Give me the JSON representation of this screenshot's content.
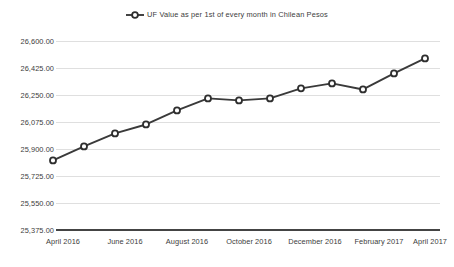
{
  "chart_data": {
    "type": "line",
    "title": "",
    "subtitle": "",
    "xlabel": "",
    "ylabel": "",
    "legend": {
      "position": "top-center",
      "entries": [
        {
          "name": "UF Value as per 1st of every month in Chilean Pesos",
          "marker": "circle-on-line",
          "color": "#3a3a3a"
        }
      ]
    },
    "grid": true,
    "ylim": [
      25375.0,
      26600.0
    ],
    "ytick_step": 175.0,
    "ytick_labels": [
      "26,600.00",
      "26,425.00",
      "26,250.00",
      "26,075.00",
      "25,900.00",
      "25,725.00",
      "25,550.00",
      "25,375.00"
    ],
    "ytick_values": [
      26600.0,
      26425.0,
      26250.0,
      26075.0,
      25900.0,
      25725.0,
      25550.0,
      25375.0
    ],
    "xtick_labels": [
      "April 2016",
      "June 2016",
      "August 2016",
      "October 2016",
      "December 2016",
      "February 2017",
      "April 2017"
    ],
    "categories": [
      "April 2016",
      "May 2016",
      "June 2016",
      "July 2016",
      "August 2016",
      "September 2016",
      "October 2016",
      "November 2016",
      "December 2016",
      "January 2017",
      "February 2017",
      "March 2017",
      "April 2017"
    ],
    "series": [
      {
        "name": "UF Value as per 1st of every month in Chilean Pesos",
        "color": "#3a3a3a",
        "values": [
          25826.0,
          25917.0,
          26001.0,
          26059.0,
          26150.0,
          26228.0,
          26215.0,
          26228.0,
          26293.0,
          26325.0,
          26286.0,
          26390.0,
          26487.0
        ]
      }
    ]
  },
  "colors": {
    "line": "#3a3a3a",
    "marker_fill": "#ffffff",
    "marker_stroke": "#2e2e2e",
    "gridline": "#d2d2d2",
    "axis": "#444444",
    "text": "#3c3c3c",
    "background": "#ffffff"
  }
}
